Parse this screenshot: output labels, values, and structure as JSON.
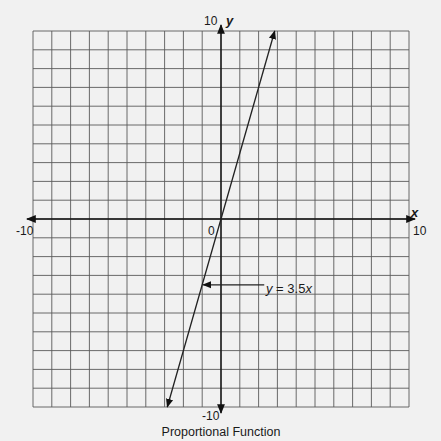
{
  "chart_data": {
    "type": "line",
    "title": "Proportional Function",
    "xlabel": "x",
    "ylabel": "y",
    "xlim": [
      -10,
      10
    ],
    "ylim": [
      -10,
      10
    ],
    "grid": true,
    "grid_step": 1,
    "tick_labels": {
      "x_min": "-10",
      "x_max": "10",
      "y_min": "-10",
      "y_max": "10",
      "origin": "0"
    },
    "series": [
      {
        "name": "y = 3.5x",
        "slope": 3.5,
        "x": [
          -2.857,
          2.857
        ],
        "y": [
          -10,
          10
        ],
        "arrows": "both"
      }
    ],
    "annotations": [
      {
        "text": "y = 3.5x",
        "text_prefix": "y",
        "text_suffix": " = 3.5",
        "text_var": "x",
        "points_to": {
          "x": -1,
          "y": -3.5
        },
        "label_at": {
          "x": 2.3,
          "y": -3.5
        }
      }
    ]
  },
  "colors": {
    "background": "#f1f1f1",
    "grid": "#5a5a5a",
    "axis": "#111111",
    "line": "#222222"
  }
}
